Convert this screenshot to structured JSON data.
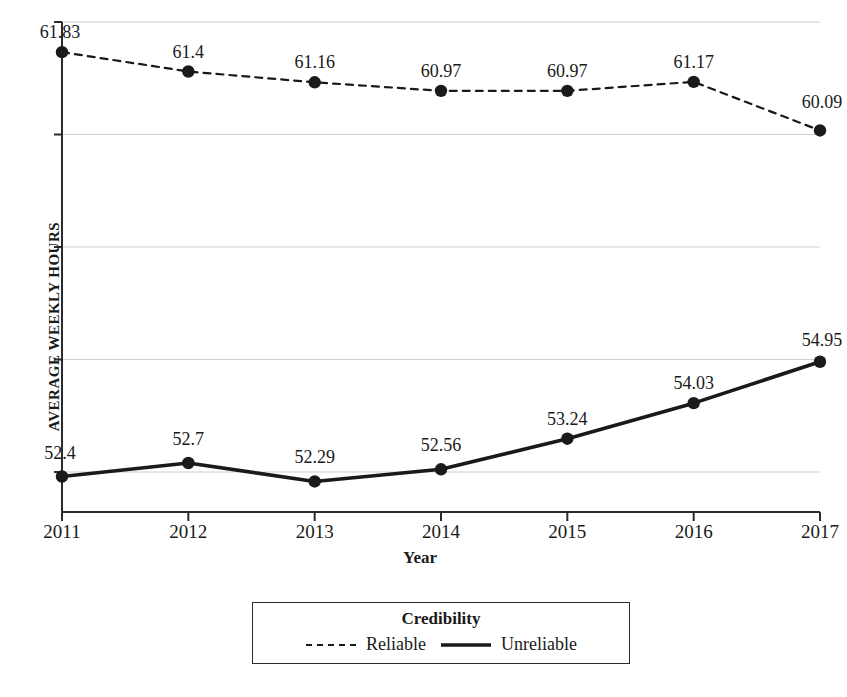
{
  "chart_data": {
    "type": "line",
    "title": "",
    "xlabel": "Year",
    "ylabel": "AVERAGE WEEKLY HOURS",
    "categories": [
      "2011",
      "2012",
      "2013",
      "2014",
      "2015",
      "2016",
      "2017"
    ],
    "ylim": [
      51.4,
      62.5
    ],
    "yticks": [
      52.5,
      55.0,
      57.5,
      60.0,
      62.5
    ],
    "ytick_labels": [
      "",
      "",
      "",
      "",
      ""
    ],
    "grid": true,
    "grid_axis": "y",
    "legend_position": "bottom",
    "legend_title": "Credibility",
    "series": [
      {
        "name": "Reliable",
        "style": "dashed",
        "color": "#1a1a1a",
        "marker": "circle",
        "values": [
          61.83,
          61.4,
          61.16,
          60.97,
          60.97,
          61.17,
          60.09
        ],
        "labels": [
          "61.83",
          "61.4",
          "61.16",
          "60.97",
          "60.97",
          "61.17",
          "60.09"
        ]
      },
      {
        "name": "Unreliable",
        "style": "solid",
        "color": "#1a1a1a",
        "marker": "circle",
        "values": [
          52.4,
          52.7,
          52.29,
          52.56,
          53.24,
          54.03,
          54.95
        ],
        "labels": [
          "52.4",
          "52.7",
          "52.29",
          "52.56",
          "53.24",
          "54.03",
          "54.95"
        ]
      }
    ]
  },
  "legend": {
    "title": "Credibility",
    "entries": [
      {
        "label": "Reliable",
        "style": "dashed"
      },
      {
        "label": "Unreliable",
        "style": "solid"
      }
    ]
  },
  "axes": {
    "x_title": "Year",
    "y_title": "AVERAGE WEEKLY HOURS"
  },
  "colors": {
    "line": "#1a1a1a",
    "grid": "#cfcfcf",
    "axis": "#2b2b2b",
    "background": "#ffffff"
  }
}
